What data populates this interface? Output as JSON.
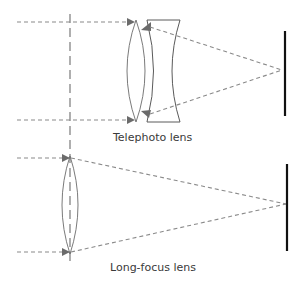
{
  "diagram": {
    "telephoto": {
      "label": "Telephoto lens",
      "elements": [
        "convex-lens",
        "concave-lens",
        "sensor"
      ],
      "focal_point": [
        282,
        70
      ]
    },
    "long_focus": {
      "label": "Long-focus lens",
      "elements": [
        "convex-lens",
        "sensor"
      ],
      "focal_point": [
        286,
        204
      ]
    },
    "colors": {
      "ray": "#8a8a8a",
      "arrow": "#6b6b6b",
      "lens": "#6b6b6b",
      "sensor": "#111111",
      "axis": "#7a7a7a",
      "text": "#3a3a3a"
    }
  }
}
